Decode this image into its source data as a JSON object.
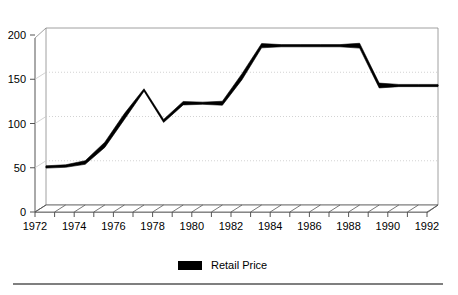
{
  "chart_data": {
    "type": "line",
    "title": "",
    "subtitle": "",
    "xlabel": "",
    "ylabel": "",
    "xlim": [
      1972,
      1992
    ],
    "ylim": [
      0,
      200
    ],
    "grid": true,
    "grid_values": [
      50,
      100,
      150
    ],
    "legend_position": "bottom-center",
    "y_ticks": [
      "0",
      "50",
      "100",
      "150",
      "200"
    ],
    "y_tick_values": [
      0,
      50,
      100,
      150,
      200
    ],
    "x_ticks": [
      "1972",
      "1974",
      "1976",
      "1978",
      "1980",
      "1982",
      "1984",
      "1986",
      "1988",
      "1990",
      "1992"
    ],
    "x_tick_values": [
      1972,
      1974,
      1976,
      1978,
      1980,
      1982,
      1984,
      1986,
      1988,
      1990,
      1992
    ],
    "x_minor_values": [
      1972,
      1973,
      1974,
      1975,
      1976,
      1977,
      1978,
      1979,
      1980,
      1981,
      1982,
      1983,
      1984,
      1985,
      1986,
      1987,
      1988,
      1989,
      1990,
      1991,
      1992
    ],
    "series": [
      {
        "name": "Retail Price",
        "color": "#000000",
        "x": [
          1972,
          1973,
          1974,
          1975,
          1976,
          1977,
          1978,
          1979,
          1980,
          1981,
          1982,
          1983,
          1984,
          1985,
          1986,
          1987,
          1988,
          1989,
          1990,
          1991,
          1992
        ],
        "values": [
          43,
          44,
          48,
          68,
          100,
          130,
          95,
          115,
          115,
          115,
          145,
          180,
          180,
          180,
          180,
          180,
          180,
          135,
          135,
          135,
          135
        ]
      }
    ]
  },
  "legend": {
    "items": [
      {
        "label": "Retail Price",
        "color": "#000000"
      }
    ]
  },
  "colors": {
    "line": "#000000",
    "grid": "#c8c8c8",
    "axis": "#555555",
    "rule": "#555555",
    "background": "#ffffff"
  }
}
